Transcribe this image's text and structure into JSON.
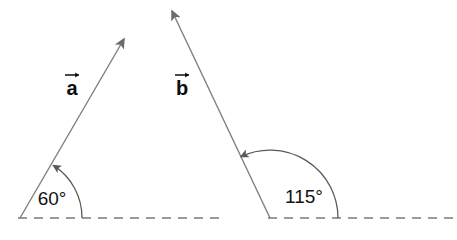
{
  "figure": {
    "background_color": "#ffffff",
    "line_color": "#7a7a7a",
    "arc_color": "#5a5a5a",
    "text_color": "#121212",
    "dash_color": "#7a7a7a"
  },
  "vectors": [
    {
      "id": "a",
      "label": "a",
      "vector_accent": "arrow-over",
      "label_x": 72,
      "label_y": 92,
      "tail_x": 20,
      "tail_y": 218,
      "tip_x": 128,
      "tip_y": 32,
      "angle_label": "60°",
      "angle_value": 60,
      "angle_unit": "degrees",
      "angle_label_x": 52,
      "angle_label_y": 205,
      "arc_radius": 62,
      "baseline": {
        "x1": 18,
        "x2": 225,
        "y": 218,
        "style": "dashed"
      }
    },
    {
      "id": "b",
      "label": "b",
      "vector_accent": "arrow-over",
      "label_x": 182,
      "label_y": 92,
      "tail_x": 270,
      "tail_y": 218,
      "tip_x": 168,
      "tip_y": 3,
      "angle_label": "115°",
      "angle_value": 115,
      "angle_unit": "degrees",
      "angle_label_x": 302,
      "angle_label_y": 203,
      "arc_radius": 68,
      "baseline": {
        "x1": 268,
        "x2": 457,
        "y": 218,
        "style": "dashed"
      }
    }
  ],
  "icons": {
    "vector_arrowhead": "arrowhead-icon",
    "arc_arrowhead": "arc-arrowhead-icon",
    "accent_arrow": "vector-accent-arrow-icon"
  }
}
